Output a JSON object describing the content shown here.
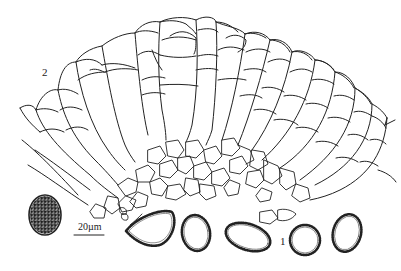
{
  "figure": {
    "labels": {
      "part_1": "1",
      "part_2": "2"
    },
    "scale_bar": {
      "text": "20µm"
    },
    "colors": {
      "line": "#222222",
      "background": "#ffffff"
    },
    "elements": [
      {
        "name": "paraphyses-and-asci-fan",
        "description": "radiating columns of cells (hymenium section)"
      },
      {
        "name": "subhymenial-tissue",
        "description": "irregular polygonal cells at base"
      },
      {
        "name": "ornamented-spore-surface-view",
        "description": "oval spore with dotted ornamentation"
      },
      {
        "name": "spores-optical-section",
        "count": 5,
        "description": "ascospores with warted walls"
      }
    ]
  }
}
